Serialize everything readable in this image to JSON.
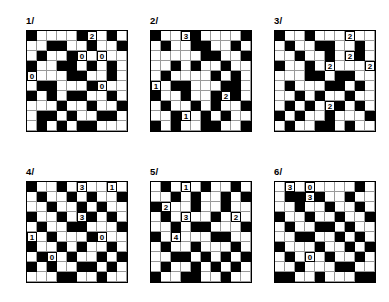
{
  "page": {
    "grid_size": 10,
    "colors": {
      "filled": "#000000",
      "empty": "#ffffff",
      "gridline": "#9a9a9a",
      "border": "#000000",
      "text": "#000000"
    }
  },
  "puzzles": [
    {
      "label": "1/",
      "x": 26,
      "y": 16,
      "rows": [
        "1000010010",
        "0011001001",
        "0100110100",
        "1001101010",
        "0000110010",
        "0110001100",
        "1010110010",
        "0001001001",
        "0110100110",
        "0101011000"
      ],
      "clues": [
        {
          "row": 0,
          "col": 6,
          "value": "2"
        },
        {
          "row": 2,
          "col": 5,
          "value": "0"
        },
        {
          "row": 2,
          "col": 7,
          "value": "0"
        },
        {
          "row": 4,
          "col": 0,
          "value": "0"
        },
        {
          "row": 5,
          "col": 7,
          "value": "0"
        }
      ]
    },
    {
      "label": "2/",
      "x": 150,
      "y": 16,
      "rows": [
        "1001100001",
        "0100110010",
        "0000011001",
        "0010100100",
        "0100001010",
        "0011000110",
        "1001001010",
        "0100101001",
        "0010010100",
        "1010011001"
      ],
      "clues": [
        {
          "row": 0,
          "col": 3,
          "value": "3"
        },
        {
          "row": 5,
          "col": 0,
          "value": "1"
        },
        {
          "row": 6,
          "col": 7,
          "value": "2"
        },
        {
          "row": 8,
          "col": 3,
          "value": "1"
        }
      ]
    },
    {
      "label": "3/",
      "x": 274,
      "y": 16,
      "rows": [
        "1001000100",
        "0100110010",
        "0010010010",
        "1001010001",
        "0001101100",
        "0100011010",
        "0010100100",
        "0101001010",
        "1010010001",
        "0100110100"
      ],
      "clues": [
        {
          "row": 0,
          "col": 7,
          "value": "2"
        },
        {
          "row": 2,
          "col": 7,
          "value": "2"
        },
        {
          "row": 3,
          "col": 5,
          "value": "2"
        },
        {
          "row": 3,
          "col": 9,
          "value": "2"
        },
        {
          "row": 7,
          "col": 5,
          "value": "2"
        }
      ]
    },
    {
      "label": "4/",
      "x": 26,
      "y": 167,
      "rows": [
        "1001010010",
        "0100101001",
        "0010010100",
        "1001001010",
        "0100110001",
        "0010001100",
        "1001010010",
        "0100100101",
        "1010011010",
        "0001100100"
      ],
      "clues": [
        {
          "row": 0,
          "col": 5,
          "value": "3"
        },
        {
          "row": 0,
          "col": 8,
          "value": "1"
        },
        {
          "row": 3,
          "col": 5,
          "value": "3"
        },
        {
          "row": 5,
          "col": 0,
          "value": "1"
        },
        {
          "row": 5,
          "col": 7,
          "value": "0"
        },
        {
          "row": 7,
          "col": 2,
          "value": "0"
        }
      ]
    },
    {
      "label": "5/",
      "x": 150,
      "y": 167,
      "rows": [
        "0101010010",
        "0010100101",
        "1100100100",
        "0101001010",
        "0010110001",
        "1010001100",
        "0100100010",
        "0011010101",
        "0100101010",
        "1001100100"
      ],
      "clues": [
        {
          "row": 0,
          "col": 3,
          "value": "1"
        },
        {
          "row": 2,
          "col": 1,
          "value": "2"
        },
        {
          "row": 3,
          "col": 3,
          "value": "3"
        },
        {
          "row": 3,
          "col": 8,
          "value": "2"
        },
        {
          "row": 5,
          "col": 2,
          "value": "4"
        }
      ]
    },
    {
      "label": "6/",
      "x": 274,
      "y": 167,
      "rows": [
        "0101000010",
        "0110100100",
        "0010010010",
        "1001001001",
        "0100110100",
        "0011001010",
        "1000100101",
        "0101010010",
        "0010001100",
        "1100100011"
      ],
      "clues": [
        {
          "row": 0,
          "col": 1,
          "value": "3"
        },
        {
          "row": 0,
          "col": 3,
          "value": "0"
        },
        {
          "row": 1,
          "col": 3,
          "value": "3"
        },
        {
          "row": 7,
          "col": 3,
          "value": "0"
        }
      ]
    }
  ]
}
